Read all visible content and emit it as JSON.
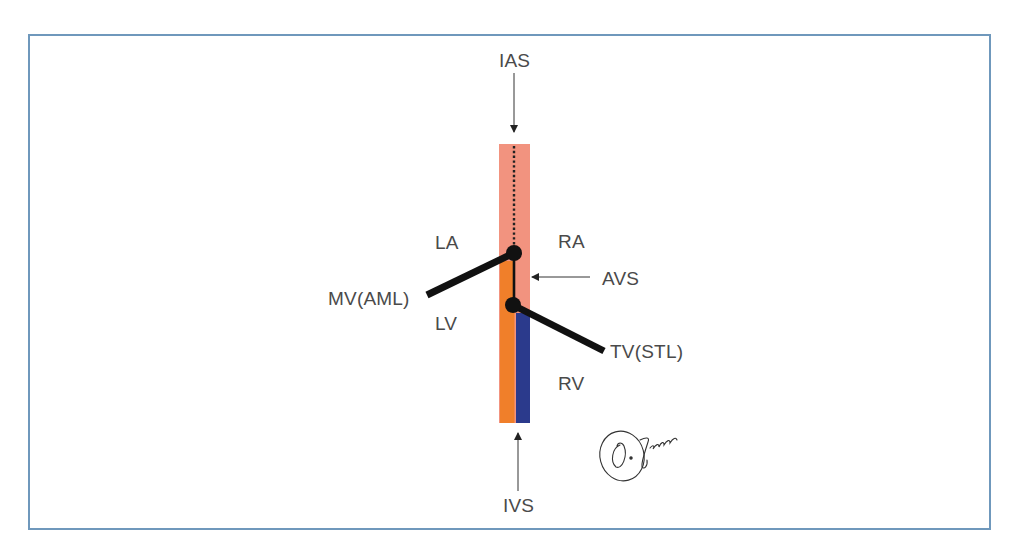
{
  "diagram": {
    "type": "anatomical-schematic",
    "colors": {
      "frame_border": "#6f98bc",
      "atrial_septum": "#f2937f",
      "left_ventricular_side": "#f07f2a",
      "right_ventricular_side": "#2b3a8c",
      "valve_leaflets": "#111111",
      "label_text": "#4a4a4a"
    },
    "labels": {
      "ias": "IAS",
      "ivs": "IVS",
      "la": "LA",
      "ra": "RA",
      "lv": "LV",
      "rv": "RV",
      "avs": "AVS",
      "mv": "MV(AML)",
      "tv": "TV(STL)"
    },
    "signature": "O. Jganen"
  }
}
